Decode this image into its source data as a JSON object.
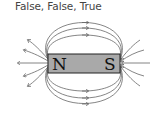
{
  "caption": "False, False, True",
  "magnet": {
    "north_label": "N",
    "south_label": "S",
    "fill_color": "#a9a9a9",
    "border_color": "#222222"
  },
  "field_lines": {
    "color": "#555555",
    "direction": "out of N, into S"
  }
}
